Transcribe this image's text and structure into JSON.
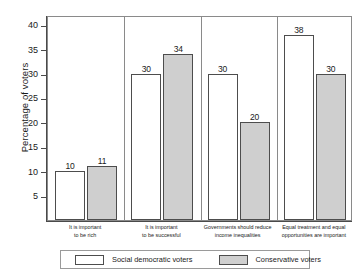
{
  "chart_data": {
    "type": "bar",
    "title": "",
    "xlabel": "",
    "ylabel": "Percentage of voters",
    "ylim": [
      0,
      42
    ],
    "yticks": [
      5,
      10,
      15,
      20,
      25,
      30,
      35,
      40
    ],
    "grid": false,
    "legend_position": "bottom",
    "categories": [
      "It is important to be rich",
      "It is important to be successful",
      "Governments should reduce income inequalities",
      "Equal treatment and equal opportunities are important"
    ],
    "category_lines": [
      [
        "It is important",
        "to be rich"
      ],
      [
        "It is important",
        "to be successful"
      ],
      [
        "Governments should reduce",
        "income inequalities"
      ],
      [
        "Equal treatment and equal",
        "opportunities are important"
      ]
    ],
    "series": [
      {
        "name": "Social democratic voters",
        "color": "#ffffff",
        "values": [
          10,
          30,
          30,
          38
        ]
      },
      {
        "name": "Conservative voters",
        "color": "#cfcfcf",
        "values": [
          11,
          34,
          20,
          30
        ]
      }
    ]
  },
  "legend": {
    "social_democratic": "Social democratic voters",
    "conservative": "Conservative voters"
  }
}
